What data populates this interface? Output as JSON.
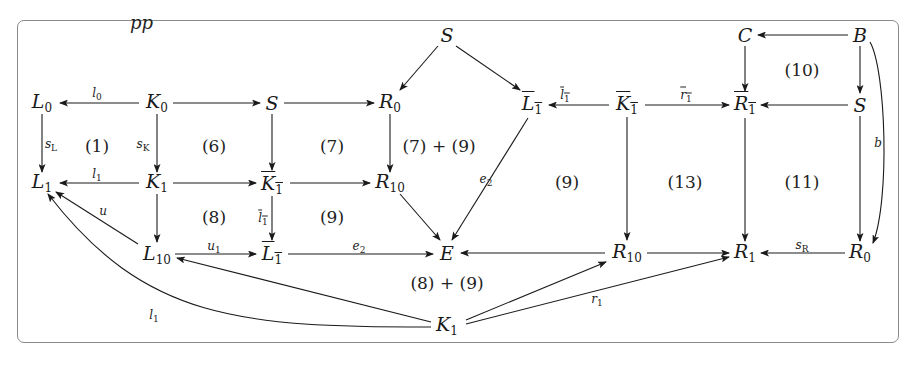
{
  "diagram": {
    "type": "commutative-diagram",
    "top_fragment": "pp",
    "nodes": [
      {
        "id": "L0",
        "base": "L",
        "sub": "0",
        "bar": false,
        "x": 42,
        "y": 103
      },
      {
        "id": "K0",
        "base": "K",
        "sub": "0",
        "bar": false,
        "x": 157,
        "y": 103
      },
      {
        "id": "S_a",
        "base": "S",
        "sub": "",
        "bar": false,
        "x": 272,
        "y": 103
      },
      {
        "id": "R0_a",
        "base": "R",
        "sub": "0",
        "bar": false,
        "x": 390,
        "y": 103
      },
      {
        "id": "S_top",
        "base": "S",
        "sub": "",
        "bar": false,
        "x": 447,
        "y": 35
      },
      {
        "id": "Lbar1_a",
        "base": "L",
        "sub": "1",
        "bar": true,
        "x": 532,
        "y": 105
      },
      {
        "id": "Kbar1_a",
        "base": "K",
        "sub": "1",
        "bar": true,
        "x": 627,
        "y": 105
      },
      {
        "id": "Rbar1",
        "base": "R",
        "sub": "1",
        "bar": true,
        "x": 745,
        "y": 105
      },
      {
        "id": "C",
        "base": "C",
        "sub": "",
        "bar": false,
        "x": 745,
        "y": 35
      },
      {
        "id": "B",
        "base": "B",
        "sub": "",
        "bar": false,
        "x": 860,
        "y": 35
      },
      {
        "id": "S_b",
        "base": "S",
        "sub": "",
        "bar": false,
        "x": 860,
        "y": 105
      },
      {
        "id": "L1",
        "base": "L",
        "sub": "1",
        "bar": false,
        "x": 42,
        "y": 183
      },
      {
        "id": "K1_a",
        "base": "K",
        "sub": "1",
        "bar": false,
        "x": 157,
        "y": 183
      },
      {
        "id": "Kbar1_b",
        "base": "K",
        "sub": "1",
        "bar": true,
        "x": 272,
        "y": 185
      },
      {
        "id": "R10_a",
        "base": "R",
        "sub": "10",
        "bar": false,
        "x": 390,
        "y": 183
      },
      {
        "id": "L10",
        "base": "L",
        "sub": "10",
        "bar": false,
        "x": 157,
        "y": 255
      },
      {
        "id": "Lbar1_b",
        "base": "L",
        "sub": "1",
        "bar": true,
        "x": 272,
        "y": 255
      },
      {
        "id": "E",
        "base": "E",
        "sub": "",
        "bar": false,
        "x": 447,
        "y": 253
      },
      {
        "id": "R10_b",
        "base": "R",
        "sub": "10",
        "bar": false,
        "x": 627,
        "y": 253
      },
      {
        "id": "R1",
        "base": "R",
        "sub": "1",
        "bar": false,
        "x": 745,
        "y": 253
      },
      {
        "id": "R0_b",
        "base": "R",
        "sub": "0",
        "bar": false,
        "x": 860,
        "y": 253
      },
      {
        "id": "K1_b",
        "base": "K",
        "sub": "1",
        "bar": false,
        "x": 447,
        "y": 326
      }
    ],
    "edge_labels": [
      {
        "id": "l0",
        "base": "l",
        "sub": "0",
        "bar": false,
        "x": 97,
        "y": 94
      },
      {
        "id": "sL",
        "base": "s",
        "sub": "L",
        "bar": false,
        "x": 51,
        "y": 145
      },
      {
        "id": "sK",
        "base": "s",
        "sub": "K",
        "bar": false,
        "x": 143,
        "y": 145
      },
      {
        "id": "l1_top",
        "base": "l",
        "sub": "1",
        "bar": false,
        "x": 97,
        "y": 175
      },
      {
        "id": "u",
        "base": "u",
        "sub": "",
        "bar": false,
        "x": 103,
        "y": 211
      },
      {
        "id": "lbar1_v",
        "base": "l",
        "sub": "1",
        "bar": true,
        "x": 263,
        "y": 219
      },
      {
        "id": "u1",
        "base": "u",
        "sub": "1",
        "bar": false,
        "x": 214,
        "y": 247
      },
      {
        "id": "e2_h",
        "base": "e",
        "sub": "2",
        "bar": false,
        "x": 359,
        "y": 247
      },
      {
        "id": "e2_d",
        "base": "e",
        "sub": "2",
        "bar": false,
        "x": 486,
        "y": 180
      },
      {
        "id": "lbar1_h",
        "base": "l",
        "sub": "1",
        "bar": true,
        "x": 565,
        "y": 96
      },
      {
        "id": "rbar1",
        "base": "r",
        "sub": "1",
        "bar": true,
        "x": 686,
        "y": 96
      },
      {
        "id": "b",
        "base": "b",
        "sub": "",
        "bar": false,
        "x": 878,
        "y": 143
      },
      {
        "id": "sR",
        "base": "s",
        "sub": "R",
        "bar": false,
        "x": 802,
        "y": 246
      },
      {
        "id": "r1",
        "base": "r",
        "sub": "1",
        "bar": false,
        "x": 597,
        "y": 300
      },
      {
        "id": "l1_curve",
        "base": "l",
        "sub": "1",
        "bar": false,
        "x": 154,
        "y": 316
      }
    ],
    "regions": [
      {
        "label": "(1)",
        "x": 97,
        "y": 146
      },
      {
        "label": "(6)",
        "x": 214,
        "y": 146
      },
      {
        "label": "(7)",
        "x": 332,
        "y": 146
      },
      {
        "label": "(7) + (9)",
        "x": 439,
        "y": 146
      },
      {
        "label": "(8)",
        "x": 214,
        "y": 217
      },
      {
        "label": "(9)",
        "x": 332,
        "y": 217
      },
      {
        "label": "(9)",
        "x": 567,
        "y": 182
      },
      {
        "label": "(13)",
        "x": 685,
        "y": 182
      },
      {
        "label": "(11)",
        "x": 802,
        "y": 182
      },
      {
        "label": "(10)",
        "x": 802,
        "y": 70
      },
      {
        "label": "(8) + (9)",
        "x": 447,
        "y": 283
      }
    ],
    "edges": [
      {
        "from": "K0",
        "to": "L0",
        "path": "M139,103 L60,103"
      },
      {
        "from": "K0",
        "to": "S_a",
        "path": "M173,103 L260,103"
      },
      {
        "from": "S_a",
        "to": "R0_a",
        "path": "M284,103 L374,103"
      },
      {
        "from": "L0",
        "to": "L1",
        "path": "M42,114 L42,172"
      },
      {
        "from": "K0",
        "to": "K1_a",
        "path": "M157,114 L157,172"
      },
      {
        "from": "S_a",
        "to": "Kbar1_b",
        "path": "M272,114 L272,170"
      },
      {
        "from": "R0_a",
        "to": "R10_a",
        "path": "M390,114 L390,172"
      },
      {
        "from": "S_top",
        "to": "R0_a",
        "path": "M438,46 L400,90"
      },
      {
        "from": "S_top",
        "to": "Lbar1_a",
        "path": "M456,46 L520,90"
      },
      {
        "from": "K1_a",
        "to": "L1",
        "path": "M139,183 L60,183"
      },
      {
        "from": "K1_a",
        "to": "Kbar1_b",
        "path": "M173,183 L256,183"
      },
      {
        "from": "Kbar1_b",
        "to": "R10_a",
        "path": "M290,183 L370,183"
      },
      {
        "from": "K1_a",
        "to": "L10",
        "path": "M157,194 L157,242"
      },
      {
        "from": "Kbar1_b",
        "to": "Lbar1_b",
        "path": "M272,196 L272,240"
      },
      {
        "from": "L10",
        "to": "L1",
        "path": "M138,244 L56,192"
      },
      {
        "from": "L10",
        "to": "Lbar1_b",
        "path": "M175,254 L256,254"
      },
      {
        "from": "Lbar1_b",
        "to": "E",
        "path": "M288,254 L433,254"
      },
      {
        "from": "R10_a",
        "to": "E",
        "path": "M400,194 L440,240"
      },
      {
        "from": "Lbar1_a",
        "to": "E",
        "path": "M528,118 L452,240"
      },
      {
        "from": "Kbar1_a",
        "to": "Lbar1_a",
        "path": "M609,105 L549,105"
      },
      {
        "from": "Kbar1_a",
        "to": "Rbar1",
        "path": "M645,105 L729,105"
      },
      {
        "from": "Kbar1_a",
        "to": "R10_b",
        "path": "M627,117 L627,240"
      },
      {
        "from": "B",
        "to": "C",
        "path": "M848,35 L758,35"
      },
      {
        "from": "C",
        "to": "Rbar1",
        "path": "M745,46 L745,91"
      },
      {
        "from": "B",
        "to": "S_b",
        "path": "M860,46 L860,93"
      },
      {
        "from": "S_b",
        "to": "Rbar1",
        "path": "M848,105 L761,105"
      },
      {
        "from": "Rbar1",
        "to": "R1",
        "path": "M745,118 L745,241"
      },
      {
        "from": "S_b",
        "to": "R0_b",
        "path": "M860,116 L860,241"
      },
      {
        "from": "B",
        "to": "R0_b",
        "path": "M870,42 C886,70 890,200 873,243"
      },
      {
        "from": "R10_b",
        "to": "E",
        "path": "M605,253 L461,253"
      },
      {
        "from": "R10_b",
        "to": "R1",
        "path": "M647,253 L729,253"
      },
      {
        "from": "R0_b",
        "to": "R1",
        "path": "M845,253 L761,253"
      },
      {
        "from": "K1_b",
        "to": "L10",
        "path": "M431,322 L177,258"
      },
      {
        "from": "K1_b",
        "to": "L1",
        "path": "M431,327 C240,327 145,320 48,194"
      },
      {
        "from": "K1_b",
        "to": "R10_b",
        "path": "M466,320 L606,262"
      },
      {
        "from": "K1_b",
        "to": "R1",
        "path": "M466,324 L729,257"
      }
    ]
  }
}
